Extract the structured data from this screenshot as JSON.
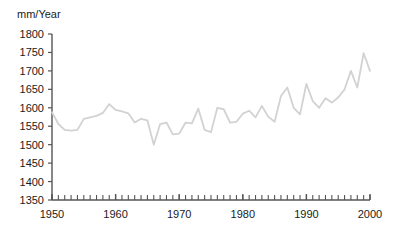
{
  "chart_data": {
    "type": "line",
    "title": "",
    "subtitle": "",
    "xlabel": "",
    "ylabel": "mm/Year",
    "xlim": [
      1950,
      2000
    ],
    "ylim": [
      1350,
      1800
    ],
    "grid": false,
    "legend": null,
    "legend_position": "none",
    "line_color": "#d2d2d2",
    "axis_color": "#555555",
    "text_color": "#1a1a1a",
    "y_ticks": [
      1350,
      1400,
      1450,
      1500,
      1550,
      1600,
      1650,
      1700,
      1750,
      1800
    ],
    "y_tick_labels": [
      "1350",
      "1400",
      "1450",
      "1500",
      "1550",
      "1600",
      "1650",
      "1700",
      "1750",
      "1800"
    ],
    "x_ticks": [
      1950,
      1960,
      1970,
      1980,
      1990,
      2000
    ],
    "x_tick_labels": [
      "1950",
      "1960",
      "1970",
      "1980",
      "1990",
      "2000"
    ],
    "x_minor_tick_step": 1,
    "series": [
      {
        "name": "Precipitation",
        "x": [
          1950,
          1951,
          1952,
          1953,
          1954,
          1955,
          1956,
          1957,
          1958,
          1959,
          1960,
          1961,
          1962,
          1963,
          1964,
          1965,
          1966,
          1967,
          1968,
          1969,
          1970,
          1971,
          1972,
          1973,
          1974,
          1975,
          1976,
          1977,
          1978,
          1979,
          1980,
          1981,
          1982,
          1983,
          1984,
          1985,
          1986,
          1987,
          1988,
          1989,
          1990,
          1991,
          1992,
          1993,
          1994,
          1995,
          1996,
          1997,
          1998,
          1999,
          2000
        ],
        "values": [
          1588,
          1556,
          1540,
          1538,
          1540,
          1570,
          1574,
          1578,
          1586,
          1610,
          1594,
          1590,
          1585,
          1560,
          1570,
          1566,
          1500,
          1556,
          1560,
          1528,
          1530,
          1560,
          1558,
          1598,
          1540,
          1534,
          1600,
          1596,
          1560,
          1562,
          1584,
          1592,
          1574,
          1605,
          1576,
          1562,
          1632,
          1655,
          1600,
          1582,
          1665,
          1618,
          1600,
          1626,
          1614,
          1628,
          1650,
          1700,
          1655,
          1748,
          1700
        ]
      }
    ]
  }
}
